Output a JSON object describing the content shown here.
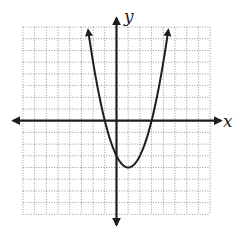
{
  "chart_data": {
    "type": "line",
    "title": "",
    "xlabel": "x",
    "ylabel": "y",
    "function": "y = x^2 - 2x - 3",
    "series": [
      {
        "name": "parabola",
        "x": [
          -2.43,
          -2,
          -1,
          0,
          1,
          2,
          3,
          4,
          4.43
        ],
        "values": [
          7.75,
          5,
          0,
          -3,
          -4,
          -3,
          0,
          5,
          7.75
        ]
      }
    ],
    "vertex": [
      1,
      -4
    ],
    "x_intercepts": [
      -1,
      3
    ],
    "y_intercept": -3,
    "xlim": [
      -8,
      8
    ],
    "ylim": [
      -8,
      8
    ],
    "grid": true,
    "grid_step": 1,
    "tick_labels": false,
    "legend": null,
    "colors": {
      "curve": "#1e1e1e",
      "axes": "#1e1e1e",
      "grid": "#8a8a8a"
    }
  },
  "labels": {
    "x_axis": "x",
    "y_axis": "y"
  }
}
